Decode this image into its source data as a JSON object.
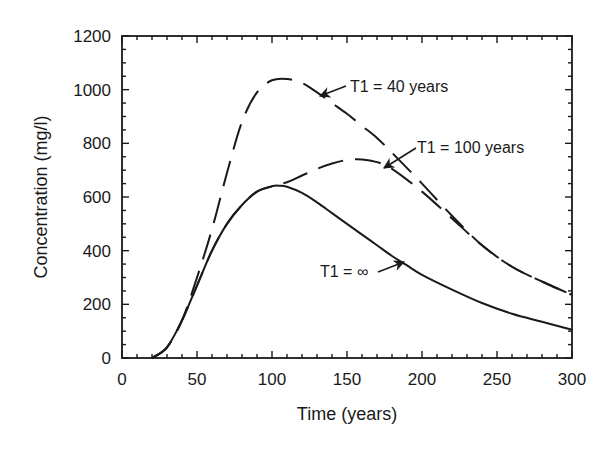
{
  "chart_data": {
    "type": "line",
    "title": "",
    "xlabel": "Time (years)",
    "ylabel": "Concentration (mg/l)",
    "xlim": [
      0,
      300
    ],
    "ylim": [
      0,
      1200
    ],
    "xticks": [
      0,
      50,
      100,
      150,
      200,
      250,
      300
    ],
    "yticks": [
      0,
      200,
      400,
      600,
      800,
      1000,
      1200
    ],
    "grid": false,
    "legend": "none (inline annotations with arrows)",
    "series": [
      {
        "name": "T1 = ∞",
        "style": "solid",
        "x": [
          20,
          30,
          40,
          50,
          60,
          70,
          80,
          90,
          100,
          105,
          110,
          120,
          130,
          140,
          150,
          160,
          170,
          180,
          190,
          200,
          220,
          240,
          260,
          280,
          300
        ],
        "y": [
          0,
          40,
          140,
          270,
          400,
          500,
          570,
          620,
          640,
          642,
          638,
          615,
          580,
          540,
          500,
          460,
          420,
          380,
          345,
          310,
          255,
          205,
          165,
          135,
          105
        ]
      },
      {
        "name": "T1 = 40 years",
        "style": "dashed",
        "x": [
          20,
          30,
          40,
          50,
          60,
          70,
          80,
          90,
          100,
          110,
          120,
          130,
          140,
          150,
          160,
          170,
          180,
          200,
          220,
          240,
          260,
          280,
          300
        ],
        "y": [
          0,
          40,
          140,
          300,
          480,
          690,
          880,
          990,
          1035,
          1040,
          1025,
          990,
          950,
          910,
          865,
          820,
          765,
          650,
          530,
          420,
          340,
          285,
          235
        ]
      },
      {
        "name": "T1 = 100 years",
        "style": "dashed",
        "x": [
          20,
          30,
          40,
          50,
          60,
          70,
          80,
          90,
          100,
          110,
          120,
          130,
          140,
          150,
          160,
          170,
          180,
          200,
          220,
          240,
          260,
          280,
          300
        ],
        "y": [
          0,
          40,
          140,
          270,
          400,
          500,
          570,
          620,
          640,
          655,
          680,
          705,
          725,
          738,
          740,
          730,
          705,
          620,
          520,
          420,
          340,
          285,
          235
        ]
      }
    ],
    "annotations": [
      {
        "text": "T1 = 40 years",
        "points_to": [
          125,
          1010
        ]
      },
      {
        "text": "T1 = 100 years",
        "points_to": [
          170,
          720
        ]
      },
      {
        "text": "T1 = ∞",
        "points_to": [
          190,
          360
        ]
      }
    ]
  },
  "labels": {
    "xlabel": "Time (years)",
    "ylabel": "Concentration (mg/l)",
    "xticks": [
      "0",
      "50",
      "100",
      "150",
      "200",
      "250",
      "300"
    ],
    "yticks": [
      "0",
      "200",
      "400",
      "600",
      "800",
      "1000",
      "1200"
    ],
    "annot_40": "T1 = 40 years",
    "annot_100": "T1 = 100 years",
    "annot_inf": "T1 = ∞"
  }
}
